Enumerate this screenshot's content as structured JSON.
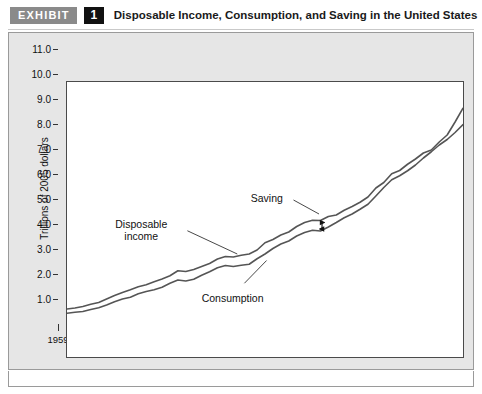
{
  "header": {
    "badge_label": "EXHIBIT",
    "number": "1",
    "title": "Disposable Income, Consumption, and Saving in the United States"
  },
  "colors": {
    "badge_gray": "#8a8a8a",
    "number_black": "#111111",
    "panel_background": "#e6e6e6",
    "plot_background": "#ffffff",
    "line_color": "#555555",
    "axis_color": "#4a4a4a"
  },
  "annotations": {
    "disposable_income_line1": "Disposable",
    "disposable_income_line2": "income",
    "consumption": "Consumption",
    "saving": "Saving"
  },
  "chart_data": {
    "type": "line",
    "title": "Disposable Income, Consumption, and Saving in the United States",
    "xlabel": "",
    "ylabel": "Trillions of 2005 dollars",
    "xlim": [
      1959,
      2009
    ],
    "ylim": [
      0,
      11
    ],
    "grid": false,
    "legend": "inline-annotations",
    "y_ticks": [
      1.0,
      2.0,
      3.0,
      4.0,
      5.0,
      6.0,
      7.0,
      8.0,
      9.0,
      10.0,
      11.0
    ],
    "y_tick_labels": [
      "1.0",
      "2.0",
      "3.0",
      "4.0",
      "5.0",
      "6.0",
      "7.0",
      "8.0",
      "9.0",
      "10.0",
      "11.0"
    ],
    "x_ticks_labeled": [
      1959,
      1963,
      1967,
      1971,
      1975,
      1979,
      1983,
      1987,
      1991,
      1995,
      1999,
      2003,
      2007
    ],
    "x_tick_labels": [
      "1959",
      "1963",
      "1967",
      "1971",
      "1975",
      "1979",
      "1983",
      "1987",
      "1991",
      "1995",
      "1999",
      "2003",
      "2007"
    ],
    "x_tick_interval_minor": 1,
    "x": [
      1959,
      1960,
      1961,
      1962,
      1963,
      1964,
      1965,
      1966,
      1967,
      1968,
      1969,
      1970,
      1971,
      1972,
      1973,
      1974,
      1975,
      1976,
      1977,
      1978,
      1979,
      1980,
      1981,
      1982,
      1983,
      1984,
      1985,
      1986,
      1987,
      1988,
      1989,
      1990,
      1991,
      1992,
      1993,
      1994,
      1995,
      1996,
      1997,
      1998,
      1999,
      2000,
      2001,
      2002,
      2003,
      2004,
      2005,
      2006,
      2007,
      2008,
      2009
    ],
    "series": [
      {
        "name": "Disposable income",
        "values": [
          1.92,
          1.96,
          2.02,
          2.11,
          2.18,
          2.32,
          2.46,
          2.58,
          2.69,
          2.81,
          2.89,
          3.01,
          3.12,
          3.25,
          3.45,
          3.42,
          3.5,
          3.62,
          3.74,
          3.92,
          4.02,
          4.0,
          4.07,
          4.12,
          4.28,
          4.57,
          4.7,
          4.88,
          5.0,
          5.22,
          5.38,
          5.47,
          5.46,
          5.62,
          5.68,
          5.87,
          6.02,
          6.19,
          6.4,
          6.76,
          6.98,
          7.33,
          7.46,
          7.71,
          7.92,
          8.16,
          8.28,
          8.6,
          8.88,
          9.4,
          9.95
        ]
      },
      {
        "name": "Consumption",
        "values": [
          1.75,
          1.79,
          1.82,
          1.9,
          1.97,
          2.08,
          2.21,
          2.32,
          2.39,
          2.53,
          2.62,
          2.69,
          2.79,
          2.95,
          3.08,
          3.04,
          3.11,
          3.27,
          3.41,
          3.57,
          3.66,
          3.62,
          3.67,
          3.71,
          3.93,
          4.12,
          4.34,
          4.52,
          4.64,
          4.84,
          4.98,
          5.07,
          5.04,
          5.2,
          5.38,
          5.57,
          5.72,
          5.91,
          6.11,
          6.44,
          6.78,
          7.09,
          7.25,
          7.45,
          7.68,
          7.96,
          8.21,
          8.48,
          8.7,
          8.98,
          9.3
        ]
      }
    ]
  }
}
